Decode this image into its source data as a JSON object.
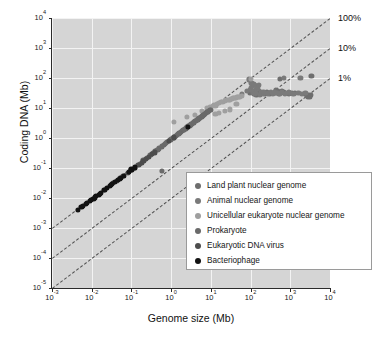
{
  "figure": {
    "top_clipped_text": "",
    "background": "#ffffff",
    "plot_background": "#d5d5d5",
    "gridline_color": "#f3f3f3",
    "axis_color": "#2b2b2b",
    "refline_color": "#4a4a4a"
  },
  "chart_data": {
    "type": "scatter",
    "title": "",
    "xlabel": "Genome size (Mb)",
    "ylabel": "Coding DNA (Mb)",
    "xscale": "log",
    "yscale": "log",
    "xlim": [
      0.001,
      10000
    ],
    "ylim": [
      1e-05,
      10000
    ],
    "grid": true,
    "legend_position": "lower-right-inside",
    "xticks": [
      {
        "exp": "-3",
        "base": "10"
      },
      {
        "exp": "-2",
        "base": "10"
      },
      {
        "exp": "-1",
        "base": "10"
      },
      {
        "exp": "0",
        "base": "10"
      },
      {
        "exp": "1",
        "base": "10"
      },
      {
        "exp": "2",
        "base": "10"
      },
      {
        "exp": "3",
        "base": "10"
      },
      {
        "exp": "4",
        "base": "10"
      }
    ],
    "yticks": [
      {
        "exp": "-5",
        "base": "10"
      },
      {
        "exp": "-4",
        "base": "10"
      },
      {
        "exp": "-3",
        "base": "10"
      },
      {
        "exp": "-2",
        "base": "10"
      },
      {
        "exp": "-1",
        "base": "10"
      },
      {
        "exp": "0",
        "base": "10"
      },
      {
        "exp": "1",
        "base": "10"
      },
      {
        "exp": "2",
        "base": "10"
      },
      {
        "exp": "3",
        "base": "10"
      },
      {
        "exp": "4",
        "base": "10"
      }
    ],
    "reference_lines": [
      {
        "label": "100%",
        "fraction": 1.0,
        "style": "dashed"
      },
      {
        "label": "10%",
        "fraction": 0.1,
        "style": "dashed"
      },
      {
        "label": "1%",
        "fraction": 0.01,
        "style": "dashed"
      }
    ],
    "series": [
      {
        "name": "Land plant nuclear genome",
        "color": "#6e6e6e",
        "size": 5.2,
        "points": [
          [
            95,
            32
          ],
          [
            120,
            30
          ],
          [
            125,
            33
          ],
          [
            140,
            28
          ],
          [
            160,
            36
          ],
          [
            230,
            30
          ],
          [
            260,
            34
          ],
          [
            300,
            29
          ],
          [
            420,
            33
          ],
          [
            480,
            36
          ],
          [
            520,
            30
          ],
          [
            560,
            95
          ],
          [
            700,
            33
          ],
          [
            900,
            30
          ],
          [
            1100,
            32
          ],
          [
            1300,
            31
          ],
          [
            2400,
            29
          ],
          [
            2600,
            26
          ],
          [
            2800,
            24
          ],
          [
            3000,
            28
          ],
          [
            3100,
            25
          ],
          [
            3200,
            23
          ],
          [
            3300,
            27
          ],
          [
            3400,
            120
          ],
          [
            430,
            40
          ],
          [
            620,
            38
          ]
        ]
      },
      {
        "name": "Animal nuclear genome",
        "color": "#7a7a7a",
        "size": 5.2,
        "points": [
          [
            60,
            30
          ],
          [
            80,
            36
          ],
          [
            95,
            40
          ],
          [
            100,
            45
          ],
          [
            110,
            55
          ],
          [
            115,
            33
          ],
          [
            120,
            38
          ],
          [
            130,
            29
          ],
          [
            135,
            31
          ],
          [
            140,
            43
          ],
          [
            160,
            60
          ],
          [
            170,
            28
          ],
          [
            180,
            34
          ],
          [
            200,
            30
          ],
          [
            210,
            35
          ],
          [
            230,
            32
          ],
          [
            260,
            31
          ],
          [
            280,
            30
          ],
          [
            320,
            34
          ],
          [
            360,
            30
          ],
          [
            400,
            33
          ],
          [
            450,
            31
          ],
          [
            500,
            32
          ],
          [
            550,
            30
          ],
          [
            600,
            35
          ],
          [
            700,
            100
          ],
          [
            750,
            30
          ],
          [
            820,
            32
          ],
          [
            900,
            33
          ],
          [
            1000,
            31
          ],
          [
            1200,
            30
          ],
          [
            1600,
            32
          ],
          [
            1800,
            100
          ],
          [
            2000,
            30
          ],
          [
            2400,
            31
          ],
          [
            90,
            90
          ],
          [
            105,
            70
          ],
          [
            118,
            65
          ],
          [
            128,
            60
          ],
          [
            150,
            48
          ]
        ]
      },
      {
        "name": "Unicellular eukaryote nuclear genome",
        "color": "#9f9f9f",
        "size": 5.2,
        "points": [
          [
            8,
            10
          ],
          [
            9.5,
            11
          ],
          [
            11,
            12
          ],
          [
            12,
            13
          ],
          [
            13,
            12
          ],
          [
            14,
            14
          ],
          [
            16,
            15
          ],
          [
            18,
            16
          ],
          [
            20,
            16
          ],
          [
            22,
            17
          ],
          [
            24,
            18
          ],
          [
            26,
            18
          ],
          [
            28,
            19
          ],
          [
            30,
            19
          ],
          [
            32,
            20
          ],
          [
            34,
            20
          ],
          [
            36,
            21
          ],
          [
            38,
            21
          ],
          [
            40,
            22
          ],
          [
            42,
            22
          ],
          [
            45,
            23
          ],
          [
            48,
            23
          ],
          [
            50,
            24
          ],
          [
            55,
            24
          ],
          [
            60,
            25
          ],
          [
            13,
            6.5
          ],
          [
            16,
            7
          ],
          [
            22,
            8
          ],
          [
            30,
            9
          ],
          [
            44,
            14
          ],
          [
            100,
            95
          ],
          [
            1.2,
            3.4
          ],
          [
            2.5,
            5
          ],
          [
            4,
            6
          ],
          [
            6,
            8
          ]
        ]
      },
      {
        "name": "Prokaryote",
        "color": "#6a6a6a",
        "size": 5.2,
        "points": [
          [
            0.5,
            0.45
          ],
          [
            0.58,
            0.52
          ],
          [
            0.65,
            0.58
          ],
          [
            0.7,
            0.62
          ],
          [
            0.8,
            0.72
          ],
          [
            0.9,
            0.8
          ],
          [
            1.0,
            0.9
          ],
          [
            1.1,
            1.0
          ],
          [
            1.2,
            1.05
          ],
          [
            1.3,
            1.15
          ],
          [
            1.4,
            1.25
          ],
          [
            1.5,
            1.35
          ],
          [
            1.6,
            1.45
          ],
          [
            1.7,
            1.5
          ],
          [
            1.8,
            1.6
          ],
          [
            1.9,
            1.7
          ],
          [
            2.0,
            1.8
          ],
          [
            2.1,
            1.9
          ],
          [
            2.2,
            2.0
          ],
          [
            2.3,
            2.05
          ],
          [
            2.4,
            2.15
          ],
          [
            2.5,
            2.25
          ],
          [
            2.6,
            2.35
          ],
          [
            2.7,
            2.45
          ],
          [
            2.8,
            2.5
          ],
          [
            2.9,
            2.6
          ],
          [
            3.0,
            2.7
          ],
          [
            3.2,
            2.85
          ],
          [
            3.4,
            3.0
          ],
          [
            3.6,
            3.2
          ],
          [
            3.8,
            3.4
          ],
          [
            4.0,
            3.6
          ],
          [
            4.2,
            3.8
          ],
          [
            4.4,
            3.9
          ],
          [
            4.6,
            4.1
          ],
          [
            4.8,
            4.3
          ],
          [
            5.0,
            4.5
          ],
          [
            5.2,
            4.6
          ],
          [
            5.5,
            4.9
          ],
          [
            5.8,
            5.2
          ],
          [
            6.0,
            5.4
          ],
          [
            6.4,
            5.7
          ],
          [
            6.8,
            6.0
          ],
          [
            7.2,
            6.4
          ],
          [
            7.6,
            6.8
          ],
          [
            8.0,
            7.2
          ],
          [
            8.5,
            7.6
          ],
          [
            9.0,
            8.0
          ],
          [
            9.5,
            8.4
          ],
          [
            10,
            8.8
          ],
          [
            0.45,
            0.4
          ],
          [
            0.6,
            0.55
          ],
          [
            0.75,
            0.68
          ],
          [
            0.95,
            0.85
          ],
          [
            1.25,
            1.1
          ],
          [
            1.55,
            1.4
          ],
          [
            2.05,
            1.85
          ],
          [
            2.55,
            2.3
          ],
          [
            3.1,
            2.8
          ],
          [
            3.7,
            3.3
          ],
          [
            4.5,
            4.0
          ],
          [
            5.4,
            4.8
          ],
          [
            6.2,
            5.5
          ],
          [
            7.0,
            6.2
          ],
          [
            8.2,
            7.4
          ],
          [
            0.25,
            0.22
          ],
          [
            0.3,
            0.27
          ],
          [
            0.35,
            0.31
          ],
          [
            0.4,
            0.36
          ],
          [
            0.2,
            0.18
          ],
          [
            0.16,
            0.14
          ],
          [
            0.58,
            0.08
          ]
        ]
      },
      {
        "name": "Eukaryotic DNA virus",
        "color": "#4d4d4d",
        "size": 5.2,
        "points": [
          [
            0.12,
            0.1
          ],
          [
            0.15,
            0.13
          ],
          [
            0.18,
            0.15
          ],
          [
            0.2,
            0.17
          ],
          [
            0.23,
            0.2
          ],
          [
            0.28,
            0.24
          ],
          [
            0.33,
            0.29
          ],
          [
            0.38,
            0.33
          ],
          [
            0.1,
            0.085
          ],
          [
            0.08,
            0.07
          ],
          [
            0.06,
            0.055
          ],
          [
            0.05,
            0.047
          ],
          [
            0.042,
            0.038
          ],
          [
            0.035,
            0.032
          ],
          [
            0.9,
            0.8
          ],
          [
            1.2,
            1.05
          ]
        ]
      },
      {
        "name": "Bacteriophage",
        "color": "#121212",
        "size": 5.2,
        "points": [
          [
            0.0055,
            0.005
          ],
          [
            0.007,
            0.0062
          ],
          [
            0.009,
            0.008
          ],
          [
            0.011,
            0.0095
          ],
          [
            0.013,
            0.012
          ],
          [
            0.015,
            0.013
          ],
          [
            0.017,
            0.015
          ],
          [
            0.02,
            0.018
          ],
          [
            0.024,
            0.021
          ],
          [
            0.028,
            0.025
          ],
          [
            0.033,
            0.03
          ],
          [
            0.038,
            0.034
          ],
          [
            0.045,
            0.04
          ],
          [
            0.055,
            0.048
          ],
          [
            0.065,
            0.056
          ],
          [
            0.085,
            0.075
          ],
          [
            0.1,
            0.09
          ],
          [
            0.12,
            0.105
          ],
          [
            0.0045,
            0.004
          ],
          [
            0.006,
            0.0053
          ],
          [
            0.0075,
            0.0068
          ],
          [
            0.0095,
            0.0085
          ],
          [
            0.012,
            0.0105
          ],
          [
            0.016,
            0.014
          ],
          [
            0.022,
            0.019
          ],
          [
            0.03,
            0.027
          ],
          [
            0.05,
            0.044
          ],
          [
            2.6,
            2.4
          ]
        ]
      }
    ]
  },
  "legend": {
    "items": [
      {
        "label": "Land plant nuclear genome",
        "color": "#6e6e6e"
      },
      {
        "label": "Animal nuclear genome",
        "color": "#7a7a7a"
      },
      {
        "label": "Unicellular eukaryote nuclear genome",
        "color": "#9f9f9f"
      },
      {
        "label": "Prokaryote",
        "color": "#6a6a6a"
      },
      {
        "label": "Eukaryotic DNA virus",
        "color": "#4d4d4d"
      },
      {
        "label": "Bacteriophage",
        "color": "#121212"
      }
    ]
  }
}
